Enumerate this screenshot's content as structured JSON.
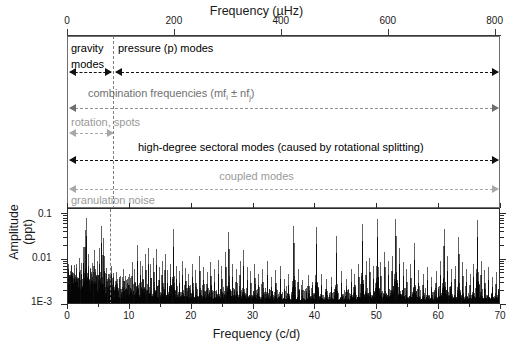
{
  "figure": {
    "top_axis": {
      "title": "Frequency (µHz)",
      "ticks": [
        {
          "label": "0",
          "value": 0
        },
        {
          "label": "200",
          "value": 200
        },
        {
          "label": "400",
          "value": 400
        },
        {
          "label": "600",
          "value": 600
        },
        {
          "label": "800",
          "value": 800
        }
      ],
      "range": [
        0,
        810
      ],
      "unit": "µHz"
    },
    "bottom_axis": {
      "title": "Frequency (c/d)",
      "ticks": [
        {
          "label": "0",
          "value": 0
        },
        {
          "label": "10",
          "value": 10
        },
        {
          "label": "20",
          "value": 20
        },
        {
          "label": "30",
          "value": 30
        },
        {
          "label": "40",
          "value": 40
        },
        {
          "label": "50",
          "value": 50
        },
        {
          "label": "60",
          "value": 60
        },
        {
          "label": "70",
          "value": 70
        }
      ],
      "range": [
        0,
        70
      ],
      "unit": "c/d"
    },
    "y_axis": {
      "title": "Amplitude (ppt)",
      "ticks": [
        {
          "label": "0.1",
          "value": 0.1
        },
        {
          "label": "0.01",
          "value": 0.01
        },
        {
          "label": "1E-3",
          "value": 0.001
        }
      ],
      "scale": "log",
      "range": [
        0.001,
        0.13
      ],
      "unit": "ppt"
    },
    "divider": {
      "label": "gravity/pressure mode boundary",
      "value_cd": 7.0,
      "style": "dashed"
    },
    "annotations": [
      {
        "name": "gravity-modes",
        "label_line1": "gravity",
        "label_line2": "modes",
        "label": "gravity modes",
        "color": "#000000",
        "arrow": "both",
        "from_cd": 0,
        "to_cd": 7
      },
      {
        "name": "pressure-modes",
        "label": "pressure (p) modes",
        "color": "#000000",
        "arrow": "both",
        "from_cd": 7,
        "to_cd": 70
      },
      {
        "name": "combination-frequencies",
        "label_pre": "combination frequencies (mf",
        "label_sub1": "i",
        "label_mid": " ± nf",
        "label_sub2": "j",
        "label_post": ")",
        "label": "combination frequencies (mfi ± nfj)",
        "color": "#6f6f6f",
        "arrow": "both",
        "from_cd": 0,
        "to_cd": 70
      },
      {
        "name": "rotation-spots",
        "label": "rotation, spots",
        "color": "#9a9a9a",
        "arrow": "both",
        "from_cd": 0,
        "to_cd": 7
      },
      {
        "name": "high-degree-sectoral-modes",
        "label": "high-degree sectoral modes (caused by rotational splitting)",
        "color": "#000000",
        "arrow": "both",
        "from_cd": 0,
        "to_cd": 70
      },
      {
        "name": "coupled-modes",
        "label": "coupled modes",
        "color": "#9a9a9a",
        "arrow": "both",
        "from_cd": 0,
        "to_cd": 70
      },
      {
        "name": "granulation-noise",
        "label": "granulation noise",
        "color": "#9a9a9a",
        "arrow": "right",
        "from_cd": 0,
        "to_cd": 12
      }
    ]
  },
  "chart_data": {
    "type": "line",
    "subtype": "amplitude-spectrum-periodogram",
    "title": "",
    "xlabel": "Frequency (c/d)",
    "ylabel": "Amplitude (ppt)",
    "xlabel_secondary": "Frequency (µHz)",
    "xlim": [
      0,
      70
    ],
    "ylim": [
      0.001,
      0.13
    ],
    "yscale": "log",
    "grid": false,
    "legend": false,
    "xtick_labels": [
      "0",
      "10",
      "20",
      "30",
      "40",
      "50",
      "60",
      "70"
    ],
    "ytick_labels": [
      "1E-3",
      "0.01",
      "0.1"
    ],
    "secondary_xtick_labels": [
      "0",
      "200",
      "400",
      "600",
      "800"
    ],
    "unit_conversion_cd_to_uHz": 11.574,
    "noise_floor_ppt": 0.0013,
    "series": [
      {
        "name": "amplitude spectrum",
        "color": "#000000",
        "peaks": [
          {
            "x": 0.6,
            "y": 0.0055
          },
          {
            "x": 1.1,
            "y": 0.0075
          },
          {
            "x": 1.5,
            "y": 0.0042
          },
          {
            "x": 1.9,
            "y": 0.011
          },
          {
            "x": 2.2,
            "y": 0.0085
          },
          {
            "x": 2.5,
            "y": 0.019
          },
          {
            "x": 2.75,
            "y": 0.045
          },
          {
            "x": 3.0,
            "y": 0.082
          },
          {
            "x": 3.3,
            "y": 0.013
          },
          {
            "x": 3.6,
            "y": 0.0065
          },
          {
            "x": 3.9,
            "y": 0.0085
          },
          {
            "x": 4.2,
            "y": 0.016
          },
          {
            "x": 4.5,
            "y": 0.0062
          },
          {
            "x": 4.8,
            "y": 0.0095
          },
          {
            "x": 5.1,
            "y": 0.018
          },
          {
            "x": 5.4,
            "y": 0.055
          },
          {
            "x": 5.7,
            "y": 0.03
          },
          {
            "x": 5.95,
            "y": 0.012
          },
          {
            "x": 6.3,
            "y": 0.0065
          },
          {
            "x": 6.7,
            "y": 0.0048
          },
          {
            "x": 7.0,
            "y": 0.0072
          },
          {
            "x": 7.4,
            "y": 0.0042
          },
          {
            "x": 7.9,
            "y": 0.0052
          },
          {
            "x": 8.4,
            "y": 0.0038
          },
          {
            "x": 8.9,
            "y": 0.0062
          },
          {
            "x": 9.4,
            "y": 0.0035
          },
          {
            "x": 9.9,
            "y": 0.0048
          },
          {
            "x": 10.4,
            "y": 0.0088
          },
          {
            "x": 10.8,
            "y": 0.0062
          },
          {
            "x": 11.2,
            "y": 0.021
          },
          {
            "x": 11.7,
            "y": 0.0095
          },
          {
            "x": 12.1,
            "y": 0.0072
          },
          {
            "x": 12.6,
            "y": 0.013
          },
          {
            "x": 13.0,
            "y": 0.018
          },
          {
            "x": 13.4,
            "y": 0.0078
          },
          {
            "x": 13.9,
            "y": 0.011
          },
          {
            "x": 14.3,
            "y": 0.017
          },
          {
            "x": 14.8,
            "y": 0.0068
          },
          {
            "x": 15.2,
            "y": 0.0092
          },
          {
            "x": 15.7,
            "y": 0.013
          },
          {
            "x": 16.1,
            "y": 0.0058
          },
          {
            "x": 16.6,
            "y": 0.0082
          },
          {
            "x": 17.0,
            "y": 0.046
          },
          {
            "x": 17.5,
            "y": 0.0072
          },
          {
            "x": 18.0,
            "y": 0.0055
          },
          {
            "x": 18.5,
            "y": 0.0095
          },
          {
            "x": 19.0,
            "y": 0.0065
          },
          {
            "x": 19.5,
            "y": 0.0048
          },
          {
            "x": 20.1,
            "y": 0.0082
          },
          {
            "x": 20.7,
            "y": 0.0058
          },
          {
            "x": 21.3,
            "y": 0.012
          },
          {
            "x": 21.9,
            "y": 0.0068
          },
          {
            "x": 22.5,
            "y": 0.0052
          },
          {
            "x": 23.1,
            "y": 0.0088
          },
          {
            "x": 23.7,
            "y": 0.0062
          },
          {
            "x": 24.3,
            "y": 0.0098
          },
          {
            "x": 24.9,
            "y": 0.0072
          },
          {
            "x": 25.5,
            "y": 0.015
          },
          {
            "x": 26.0,
            "y": 0.041
          },
          {
            "x": 26.6,
            "y": 0.0082
          },
          {
            "x": 27.2,
            "y": 0.0062
          },
          {
            "x": 27.8,
            "y": 0.0095
          },
          {
            "x": 28.4,
            "y": 0.016
          },
          {
            "x": 29.0,
            "y": 0.0068
          },
          {
            "x": 29.6,
            "y": 0.0055
          },
          {
            "x": 30.2,
            "y": 0.0078
          },
          {
            "x": 30.8,
            "y": 0.0048
          },
          {
            "x": 31.5,
            "y": 0.0062
          },
          {
            "x": 32.2,
            "y": 0.0092
          },
          {
            "x": 32.9,
            "y": 0.0042
          },
          {
            "x": 33.6,
            "y": 0.0058
          },
          {
            "x": 34.3,
            "y": 0.0072
          },
          {
            "x": 35.0,
            "y": 0.0038
          },
          {
            "x": 35.7,
            "y": 0.0048
          },
          {
            "x": 36.5,
            "y": 0.055
          },
          {
            "x": 37.2,
            "y": 0.0062
          },
          {
            "x": 38.0,
            "y": 0.0035
          },
          {
            "x": 38.8,
            "y": 0.0045
          },
          {
            "x": 39.5,
            "y": 0.0032
          },
          {
            "x": 40.2,
            "y": 0.052
          },
          {
            "x": 41.0,
            "y": 0.0048
          },
          {
            "x": 41.8,
            "y": 0.0038
          },
          {
            "x": 42.6,
            "y": 0.0042
          },
          {
            "x": 43.4,
            "y": 0.033
          },
          {
            "x": 44.2,
            "y": 0.0055
          },
          {
            "x": 45.0,
            "y": 0.0038
          },
          {
            "x": 45.8,
            "y": 0.0062
          },
          {
            "x": 46.4,
            "y": 0.0048
          },
          {
            "x": 47.0,
            "y": 0.0082
          },
          {
            "x": 47.6,
            "y": 0.062
          },
          {
            "x": 48.2,
            "y": 0.0095
          },
          {
            "x": 48.8,
            "y": 0.011
          },
          {
            "x": 49.4,
            "y": 0.0072
          },
          {
            "x": 50.0,
            "y": 0.078
          },
          {
            "x": 50.6,
            "y": 0.0088
          },
          {
            "x": 51.2,
            "y": 0.015
          },
          {
            "x": 51.8,
            "y": 0.0092
          },
          {
            "x": 52.4,
            "y": 0.012
          },
          {
            "x": 53.0,
            "y": 0.079
          },
          {
            "x": 53.6,
            "y": 0.018
          },
          {
            "x": 54.2,
            "y": 0.0088
          },
          {
            "x": 54.8,
            "y": 0.0062
          },
          {
            "x": 55.4,
            "y": 0.0078
          },
          {
            "x": 56.0,
            "y": 0.023
          },
          {
            "x": 56.7,
            "y": 0.0058
          },
          {
            "x": 57.4,
            "y": 0.0048
          },
          {
            "x": 58.1,
            "y": 0.0068
          },
          {
            "x": 58.8,
            "y": 0.0042
          },
          {
            "x": 59.5,
            "y": 0.0055
          },
          {
            "x": 60.2,
            "y": 0.0092
          },
          {
            "x": 60.8,
            "y": 0.048
          },
          {
            "x": 61.4,
            "y": 0.012
          },
          {
            "x": 62.0,
            "y": 0.0062
          },
          {
            "x": 62.6,
            "y": 0.0072
          },
          {
            "x": 63.2,
            "y": 0.031
          },
          {
            "x": 63.8,
            "y": 0.0088
          },
          {
            "x": 64.4,
            "y": 0.0062
          },
          {
            "x": 65.0,
            "y": 0.0048
          },
          {
            "x": 65.6,
            "y": 0.0082
          },
          {
            "x": 66.2,
            "y": 0.075
          },
          {
            "x": 66.8,
            "y": 0.0092
          },
          {
            "x": 67.4,
            "y": 0.0058
          },
          {
            "x": 68.0,
            "y": 0.0068
          },
          {
            "x": 68.6,
            "y": 0.0042
          },
          {
            "x": 69.2,
            "y": 0.0052
          },
          {
            "x": 69.7,
            "y": 0.0038
          }
        ]
      }
    ]
  }
}
